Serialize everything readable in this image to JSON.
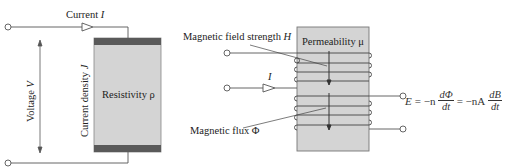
{
  "diagram": {
    "left_panel": {
      "current_label": "Current ",
      "current_symbol": "I",
      "voltage_label": "Voltage ",
      "voltage_symbol": "V",
      "current_density_label": "Current density ",
      "current_density_symbol": "J",
      "resistivity_label": "Resistivity ρ"
    },
    "right_panel": {
      "field_strength_label": "Magnetic field strength ",
      "field_strength_symbol": "H",
      "permeability_label": "Permeability μ",
      "input_current_symbol": "I",
      "flux_label": "Magnetic flux Φ",
      "equation": {
        "lhs": "E",
        "eq1": "= −n",
        "frac1_num": "dΦ",
        "frac1_den": "dt",
        "eq2": "= −nA",
        "frac2_num": "dB",
        "frac2_den": "dt"
      }
    },
    "colors": {
      "body_fill": "#d4d4d4",
      "electrode_fill": "#5a5a5a",
      "line": "#444444"
    }
  }
}
